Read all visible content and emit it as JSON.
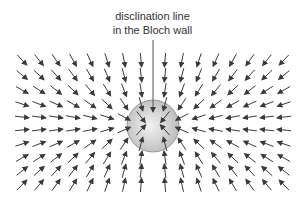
{
  "diagram": {
    "label_line1": "disclination line",
    "label_line2": "in the Bloch wall",
    "colors": {
      "arrow": "#3a3a3a",
      "leader": "#555555",
      "circle_fill_center": "#f2f2f2",
      "circle_fill_edge": "#bdbdbd",
      "circle_stroke": "#888888"
    },
    "circle": {
      "cx": 153,
      "cy": 126,
      "r": 26
    },
    "leader_line": {
      "x": 153,
      "y1": 40,
      "y2": 112
    },
    "field": {
      "description": "vector field of arrows converging on the disclination",
      "center": {
        "x": 153,
        "y": 124
      },
      "columns_x": [
        22,
        39,
        56,
        73,
        90,
        107,
        124,
        141,
        165,
        182,
        199,
        216,
        233,
        250,
        267,
        284
      ],
      "rows_y": [
        60,
        75,
        90,
        104,
        117,
        130,
        144,
        158,
        171,
        185
      ],
      "arrow_length": 14
    }
  }
}
